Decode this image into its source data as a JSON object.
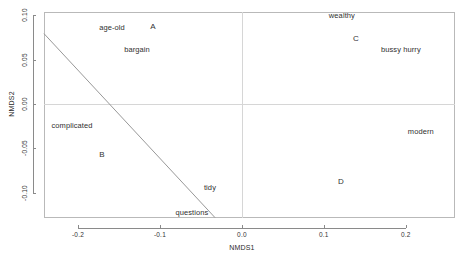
{
  "chart_data": {
    "type": "scatter",
    "title": "",
    "xlabel": "NMDS1",
    "ylabel": "NMDS2",
    "xlim": [
      -0.2415,
      0.26
    ],
    "ylim": [
      -0.1285,
      0.1037
    ],
    "xticks": [
      -0.2,
      -0.1,
      0.0,
      0.1,
      0.2
    ],
    "xticklabels": [
      "-0.2",
      "-0.1",
      "0.0",
      "0.1",
      "0.2"
    ],
    "yticks": [
      -0.1,
      -0.05,
      0.0,
      0.05,
      0.1
    ],
    "yticklabels": [
      "-0.10",
      "-0.05",
      "0.00",
      "0.05",
      "0.10"
    ],
    "grid": false,
    "reference_lines": [
      {
        "name": "vertical-zero",
        "axis": "x",
        "value": 0.0
      },
      {
        "name": "horizontal-zero",
        "axis": "y",
        "value": 0.0
      }
    ],
    "fit_line": {
      "name": "envfit-vector-line",
      "x0": -0.2415,
      "y0": 0.0793,
      "x1": -0.0329,
      "y1": -0.128
    },
    "species_labels": [
      {
        "text": "age-old",
        "x": -0.1585,
        "y": 0.0866
      },
      {
        "text": "bargain",
        "x": -0.128,
        "y": 0.0622
      },
      {
        "text": "complicated",
        "x": -0.2073,
        "y": -0.0232
      },
      {
        "text": "tidy",
        "x": -0.039,
        "y": -0.0939
      },
      {
        "text": "questions",
        "x": -0.061,
        "y": -0.122
      },
      {
        "text": "wealthy",
        "x": 0.122,
        "y": 0.1
      },
      {
        "text": "bussy hurry",
        "x": 0.1939,
        "y": 0.0622
      },
      {
        "text": "modern",
        "x": 0.2183,
        "y": -0.0305
      }
    ],
    "group_labels": [
      {
        "text": "A",
        "x": -0.1085,
        "y": 0.0878
      },
      {
        "text": "B",
        "x": -0.1707,
        "y": -0.0561
      },
      {
        "text": "C",
        "x": 0.139,
        "y": 0.0744
      },
      {
        "text": "D",
        "x": 0.1207,
        "y": -0.0866
      }
    ]
  },
  "colors": {
    "frame": "#b9b9b9",
    "reference_line": "#d6d6d6",
    "fit_line": "#8c8c8c",
    "axis": "#8a8a8a",
    "text": "#2f2f2f",
    "background": "#ffffff"
  }
}
